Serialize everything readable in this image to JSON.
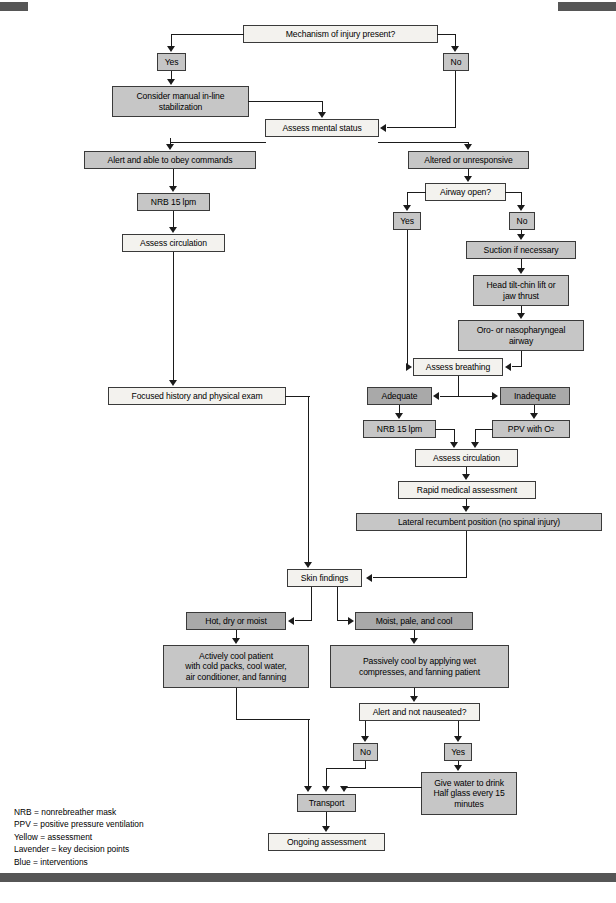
{
  "document": {
    "type": "clinical-algorithm-flowchart",
    "title": "Heat emergency patient assessment algorithm"
  },
  "colors": {
    "assessment_box": "#f3f2ee",
    "decision_box": "#a9a9a9",
    "intervention_box": "#c6c6c6",
    "connector": "#1b1b1b",
    "page_bar": "#565656"
  },
  "nodes": {
    "mechanism_of_injury": "Mechanism of injury present?",
    "moi_yes": "Yes",
    "moi_no": "No",
    "manual_stabilization": "Consider manual in-line\nstabilization",
    "assess_mental_status": "Assess mental status",
    "alert_obey": "Alert and able to obey commands",
    "altered_unresponsive": "Altered or unresponsive",
    "nrb_left": "NRB 15 lpm",
    "assess_circulation_left": "Assess circulation",
    "airway_open": "Airway open?",
    "airway_yes": "Yes",
    "airway_no": "No",
    "suction": "Suction if necessary",
    "head_tilt": "Head tilt-chin lift or\njaw thrust",
    "oro_naso_airway": "Oro- or nasopharyngeal\nairway",
    "assess_breathing": "Assess breathing",
    "adequate": "Adequate",
    "inadequate": "Inadequate",
    "nrb_right": "NRB 15 lpm",
    "ppv": "PPV with O",
    "ppv_sub": "2",
    "focused_history": "Focused history and physical exam",
    "assess_circulation_right": "Assess circulation",
    "rapid_medical_assessment": "Rapid medical assessment",
    "lateral_recumbent": "Lateral recumbent position (no spinal injury)",
    "skin_findings": "Skin findings",
    "hot_dry_moist": "Hot, dry or moist",
    "moist_pale_cool": "Moist, pale, and cool",
    "actively_cool": "Actively cool patient\nwith cold packs, cool water,\nair conditioner, and fanning",
    "passively_cool": "Passively cool by applying wet\ncompresses, and fanning patient",
    "alert_not_nauseated": "Alert and not nauseated?",
    "alert_no": "No",
    "alert_yes": "Yes",
    "give_water": "Give water to drink\nHalf glass every 15\nminutes",
    "transport": "Transport",
    "ongoing_assessment": "Ongoing assessment"
  },
  "legend": {
    "lines": [
      "NRB = nonrebreather mask",
      "PPV = positive pressure ventilation",
      "Yellow = assessment",
      "Lavender = key decision points",
      "Blue = interventions"
    ]
  }
}
